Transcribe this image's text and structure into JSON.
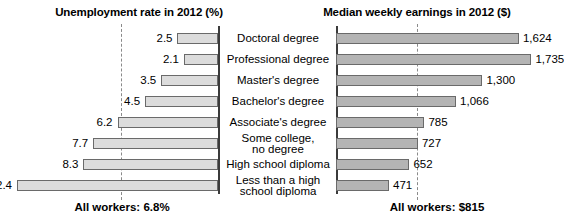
{
  "chart_data": {
    "type": "bar",
    "layout": "paired horizontal bar chart (diverging), shared category axis in center",
    "categories": [
      "Doctoral degree",
      "Professional degree",
      "Master's degree",
      "Bachelor's degree",
      "Associate's degree",
      "Some college,\nno degree",
      "High school diploma",
      "Less than a high\nschool diploma"
    ],
    "series": [
      {
        "name": "Unemployment rate in 2012 (%)",
        "panel": "left",
        "direction": "right-to-left",
        "unit": "%",
        "values": [
          2.5,
          2.1,
          3.5,
          4.5,
          6.2,
          7.7,
          8.3,
          12.4
        ],
        "value_labels": [
          "2.5",
          "2.1",
          "3.5",
          "4.5",
          "6.2",
          "7.7",
          "8.3",
          "12.4"
        ],
        "xlim": [
          0,
          13.2
        ],
        "reference_line": 6.8,
        "reference_label": "All workers: 6.8%",
        "bar_color": "#dcdcdc",
        "bar_border": "#6a6a6a"
      },
      {
        "name": "Median weekly earnings in 2012 ($)",
        "panel": "right",
        "direction": "left-to-right",
        "unit": "$",
        "values": [
          1624,
          1735,
          1300,
          1066,
          785,
          727,
          652,
          471
        ],
        "value_labels": [
          "1,624",
          "1,735",
          "1,300",
          "1,066",
          "785",
          "727",
          "652",
          "471"
        ],
        "xlim": [
          0,
          1900
        ],
        "reference_line": 815,
        "reference_label": "All workers: $815",
        "bar_color": "#b4b4b4",
        "bar_border": "#6a6a6a"
      }
    ],
    "grid": false,
    "legend": "none",
    "axis_ticks": "none"
  },
  "headings": {
    "left": "Unemployment rate in 2012 (%)",
    "right": "Median weekly earnings in 2012 ($)"
  },
  "footers": {
    "left": "All workers: 6.8%",
    "right": "All workers: $815"
  },
  "rows": [
    {
      "category": "Doctoral degree",
      "unemployment": "2.5",
      "earnings": "1,624"
    },
    {
      "category": "Professional degree",
      "unemployment": "2.1",
      "earnings": "1,735"
    },
    {
      "category": "Master's degree",
      "unemployment": "3.5",
      "earnings": "1,300"
    },
    {
      "category": "Bachelor's degree",
      "unemployment": "4.5",
      "earnings": "1,066"
    },
    {
      "category": "Associate's degree",
      "unemployment": "6.2",
      "earnings": "785"
    },
    {
      "category": "Some college,\nno degree",
      "unemployment": "7.7",
      "earnings": "727"
    },
    {
      "category": "High school diploma",
      "unemployment": "8.3",
      "earnings": "652"
    },
    {
      "category": "Less than a high\nschool diploma",
      "unemployment": "12.4",
      "earnings": "471"
    }
  ],
  "colors": {
    "left_bar": "#dcdcdc",
    "right_bar": "#b4b4b4",
    "bar_border": "#6a6a6a",
    "axis": "#3b3b3b",
    "refline": "#8a8a8a",
    "text": "#000000",
    "background": "#ffffff"
  }
}
